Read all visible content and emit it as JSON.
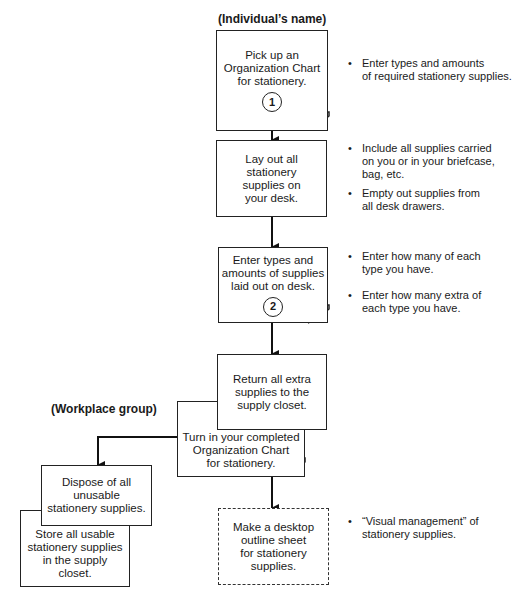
{
  "labels": {
    "individual": "(Individual’s name)",
    "workplace": "(Workplace group)"
  },
  "steps": [
    {
      "text": "Pick up an\nOrganization Chart\nfor stationery.",
      "number": "1"
    },
    {
      "text": "Lay out all\nstationery\nsupplies on\nyour desk."
    },
    {
      "text": "Enter types and\namounts of supplies\nlaid out on desk.",
      "number": "2"
    },
    {
      "text": "Return all extra\nsupplies to the\nsupply closet."
    },
    {
      "text": "Turn in your completed\nOrganization Chart\nfor stationery."
    },
    {
      "text": "Dispose of all\nunusable\nstationery supplies."
    },
    {
      "text": "Store all usable\nstationery supplies\nin the supply\ncloset."
    },
    {
      "text": "Make a desktop\noutline sheet\nfor stationery\nsupplies."
    }
  ],
  "notes": [
    "Enter types and amounts\nof required stationery supplies.",
    "Include all supplies carried\non you or in your briefcase,\nbag, etc.",
    "Empty out supplies from\nall desk drawers.",
    "Enter how many of each\ntype you have.",
    "Enter how many extra of\neach type you have.",
    "“Visual management” of\nstationery supplies."
  ]
}
